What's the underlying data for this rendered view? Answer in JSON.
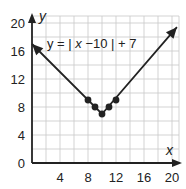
{
  "chart_data": {
    "type": "line",
    "title": "",
    "equation": "y = | x−10 | + 7",
    "xlabel": "x",
    "ylabel": "y",
    "xlim": [
      0,
      21
    ],
    "ylim": [
      0,
      21
    ],
    "grid": true,
    "grid_step": 2,
    "x_ticks": [
      4,
      8,
      12,
      16,
      20
    ],
    "y_ticks": [
      0,
      4,
      8,
      12,
      16,
      20
    ],
    "line": {
      "description": "absolute value V with arrows at both ends",
      "points": [
        [
          0,
          17
        ],
        [
          10,
          7
        ],
        [
          20.7,
          19.4
        ]
      ]
    },
    "points": [
      {
        "x": 8,
        "y": 9
      },
      {
        "x": 9,
        "y": 8
      },
      {
        "x": 10,
        "y": 7
      },
      {
        "x": 11,
        "y": 8
      },
      {
        "x": 12,
        "y": 9
      }
    ]
  },
  "labels": {
    "x_axis": "x",
    "y_axis": "y",
    "eq_prefix": "y = | ",
    "eq_var": "x",
    "eq_suffix": " −10 | + 7",
    "x_ticks": [
      "4",
      "8",
      "12",
      "16",
      "20"
    ],
    "y_ticks": [
      "0",
      "4",
      "8",
      "12",
      "16",
      "20"
    ]
  }
}
